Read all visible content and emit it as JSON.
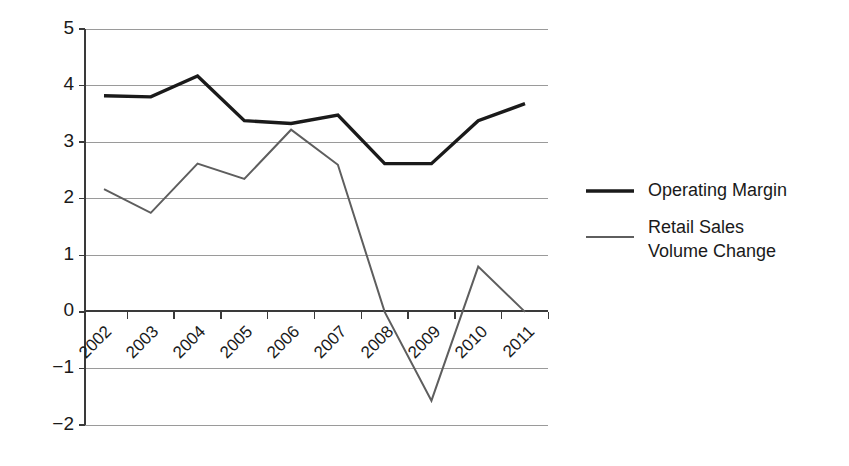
{
  "chart_data": {
    "type": "line",
    "title": "",
    "subtitle": "",
    "xlabel": "",
    "ylabel": "",
    "categories": [
      "2002",
      "2003",
      "2004",
      "2005",
      "2006",
      "2007",
      "2008",
      "2009",
      "2010",
      "2011"
    ],
    "series": [
      {
        "name": "Operating Margin",
        "color": "#1a1a1a",
        "stroke_width": 3.4,
        "values": [
          3.82,
          3.8,
          4.17,
          3.38,
          3.33,
          3.48,
          2.62,
          2.62,
          3.38,
          3.68
        ]
      },
      {
        "name": "Retail Sales Volume Change",
        "color": "#5e5e5e",
        "stroke_width": 2.0,
        "values": [
          2.17,
          1.75,
          2.62,
          2.35,
          3.22,
          2.6,
          0.0,
          -1.57,
          0.8,
          0.0
        ]
      }
    ],
    "ylim": [
      -2,
      5
    ],
    "yticks": [
      5,
      4,
      3,
      2,
      1,
      0,
      -1,
      -2
    ],
    "ytick_labels": [
      "5",
      "4",
      "3",
      "2",
      "1",
      "0",
      "−1",
      "−2"
    ],
    "grid": true,
    "grid_axis": "y",
    "xtick_rotation": -45,
    "legend_position": "right",
    "legend": [
      {
        "label": "Operating Margin",
        "color": "#1a1a1a",
        "lines": [
          "Operating Margin"
        ]
      },
      {
        "label": "Retail Sales Volume Change",
        "color": "#5e5e5e",
        "lines": [
          "Retail Sales",
          "Volume Change"
        ]
      }
    ]
  },
  "legend": {
    "entry_0_line_0": "Operating Margin",
    "entry_1_line_0": "Retail Sales",
    "entry_1_line_1": "Volume Change"
  },
  "yaxis": {
    "t0": "5",
    "t1": "4",
    "t2": "3",
    "t3": "2",
    "t4": "1",
    "t5": "0",
    "t6": "−1",
    "t7": "−2"
  },
  "xaxis": {
    "t0": "2002",
    "t1": "2003",
    "t2": "2004",
    "t3": "2005",
    "t4": "2006",
    "t5": "2007",
    "t6": "2008",
    "t7": "2009",
    "t8": "2010",
    "t9": "2011"
  },
  "colors": {
    "operating_margin": "#1a1a1a",
    "retail_sales": "#5e5e5e",
    "grid": "#9a9a9a",
    "axis": "#3a3a3a",
    "background": "#ffffff"
  }
}
